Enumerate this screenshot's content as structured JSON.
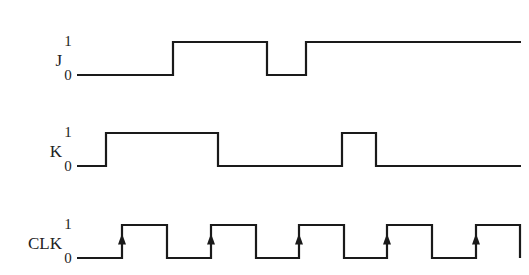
{
  "diagram": {
    "type": "timing-diagram",
    "line_color": "#1a1a1a",
    "signals": [
      {
        "name": "J",
        "high_label": "1",
        "low_label": "0",
        "y_high": 42,
        "y_low": 75,
        "label_x": 50,
        "level_label_x": 66,
        "start_x": 77,
        "end_x": 521,
        "initial": 0,
        "transitions": [
          173,
          267,
          306
        ]
      },
      {
        "name": "K",
        "high_label": "1",
        "low_label": "0",
        "y_high": 133,
        "y_low": 166,
        "label_x": 50,
        "level_label_x": 66,
        "start_x": 77,
        "end_x": 521,
        "initial": 0,
        "transitions": [
          106,
          218,
          342,
          376
        ]
      },
      {
        "name": "CLK",
        "high_label": "1",
        "low_label": "0",
        "y_high": 225,
        "y_low": 258,
        "label_x": 50,
        "level_label_x": 66,
        "start_x": 77,
        "end_x": 520,
        "initial": 0,
        "transitions": [
          122,
          167,
          211,
          256,
          299,
          344,
          387,
          432,
          476,
          520
        ],
        "rising_edge_arrows": [
          122,
          211,
          299,
          387,
          476
        ]
      }
    ]
  }
}
